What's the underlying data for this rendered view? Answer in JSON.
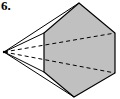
{
  "figure": {
    "label": "6.",
    "colors": {
      "face_fill": "#c0c0c0",
      "stroke": "#000000",
      "background": "#ffffff"
    },
    "apex": [
      4,
      52
    ],
    "hexagon_vertices": [
      [
        79,
        3
      ],
      [
        115,
        33
      ],
      [
        115,
        73
      ],
      [
        74,
        97
      ],
      [
        44,
        72
      ],
      [
        44,
        33
      ]
    ],
    "solid_lateral_edges": [
      [
        [
          4,
          52
        ],
        [
          79,
          3
        ]
      ],
      [
        [
          4,
          52
        ],
        [
          44,
          33
        ]
      ],
      [
        [
          4,
          52
        ],
        [
          44,
          72
        ]
      ],
      [
        [
          4,
          52
        ],
        [
          74,
          97
        ]
      ]
    ],
    "hidden_lateral_edges": [
      [
        [
          4,
          52
        ],
        [
          115,
          33
        ]
      ],
      [
        [
          4,
          52
        ],
        [
          115,
          73
        ]
      ]
    ]
  }
}
